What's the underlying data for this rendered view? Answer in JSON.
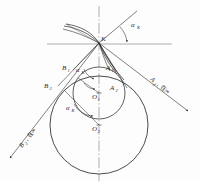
{
  "figure": {
    "type": "engineering-geometry-diagram",
    "background_color": "#fdfdfd",
    "ink_color": "#2b2b2b",
    "light_ink_color": "#6e6e6e"
  },
  "labels": {
    "point_k": "K",
    "alpha_k_top": "α",
    "alpha_k_top_sub": "K",
    "alpha_k_mid": "α",
    "alpha_k_mid_sub": "K",
    "alpha_k_low": "α",
    "alpha_k_low_sub": "K",
    "point_b1": "B",
    "point_b1_sub": "1",
    "point_a1": "A",
    "point_a1_sub": "1",
    "point_b2": "B",
    "point_b2_sub": "2",
    "point_a2": "A",
    "point_a2_sub": "2",
    "center_o1": "O",
    "center_o1_sub": "1",
    "center_o2": "O",
    "center_o2_sub": "2",
    "ray_right_label": "A",
    "ray_right_label_sub": "2",
    "ray_right_label_tail": ", 在∞",
    "ray_left_label": "B",
    "ray_left_label_sub": "2",
    "ray_left_label_tail": ", 在∞"
  },
  "geometry": {
    "K": {
      "x": 99.0,
      "y": 43.0
    },
    "O1": {
      "x": 99.0,
      "y": 93.0
    },
    "O2": {
      "x": 99.0,
      "y": 125.0
    },
    "circle_1_radius": 26.0,
    "circle_2_radius": 49.0,
    "alpha_k_degrees": 22,
    "horizontal_line": {
      "x1": 47,
      "x2": 172,
      "y": 44
    },
    "vertical_axis": {
      "x": 99,
      "y1": 6,
      "y2": 180
    },
    "ray_right": {
      "x1": 99,
      "y1": 43,
      "x2": 190,
      "y2": 112
    },
    "ray_left": {
      "x1": 99,
      "y1": 43,
      "x2": 8,
      "y2": 160
    },
    "ray_up": {
      "x1": 99,
      "y1": 43,
      "x2": 136,
      "y2": 12
    }
  }
}
